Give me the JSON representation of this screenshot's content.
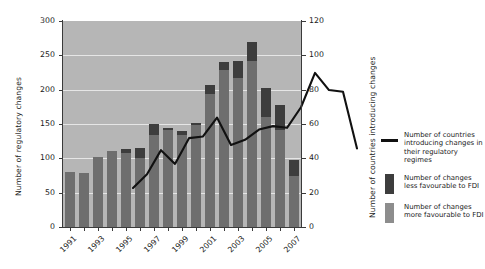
{
  "chart_data": {
    "type": "bar",
    "title": "",
    "subtitle": "",
    "xlabel": "",
    "ylabel": "Number of regulatory changes",
    "ylabel_right": "Number of countries introducing changes",
    "ylim": [
      0,
      300
    ],
    "ylim_right": [
      0,
      120
    ],
    "yticks": [
      0,
      50,
      100,
      150,
      200,
      250,
      300
    ],
    "yticks_right": [
      0,
      20,
      40,
      60,
      80,
      100,
      120
    ],
    "grid": true,
    "legend_position": "right",
    "x": [
      1991,
      1992,
      1993,
      1994,
      1995,
      1996,
      1997,
      1998,
      1999,
      2000,
      2001,
      2002,
      2003,
      2004,
      2005,
      2006,
      2007
    ],
    "xtick_labels": [
      "1991",
      "",
      "1993",
      "",
      "1995",
      "",
      "1997",
      "",
      "1999",
      "",
      "2001",
      "",
      "2003",
      "",
      "2005",
      "",
      "2007"
    ],
    "xtick_labels_shown": [
      "1991",
      "1993",
      "1995",
      "1997",
      "1999",
      "2001",
      "2003",
      "2005",
      "2007"
    ],
    "series": [
      {
        "name": "Number of changes more favourable to FDI",
        "type": "bar-segment",
        "color": "#6e6e6e",
        "values": [
          80,
          78,
          102,
          110,
          108,
          100,
          134,
          142,
          134,
          149,
          193,
          229,
          217,
          242,
          160,
          141,
          74
        ]
      },
      {
        "name": "Number of changes less favourable to FDI",
        "type": "bar-segment",
        "color": "#3d3d3d",
        "values": [
          0,
          0,
          0,
          0,
          5,
          15,
          16,
          2,
          6,
          2,
          14,
          12,
          25,
          28,
          42,
          37,
          24
        ]
      },
      {
        "name": "Number of changes (total)",
        "type": "bar-total",
        "values": [
          80,
          78,
          102,
          110,
          113,
          115,
          150,
          144,
          140,
          151,
          207,
          241,
          242,
          270,
          202,
          178,
          98
        ]
      },
      {
        "name": "Number of countries introducing changes in their regulatory regimes",
        "type": "line",
        "color": "#111111",
        "axis": "right",
        "values": [
          35,
          43,
          57,
          49,
          64,
          65,
          76,
          60,
          63,
          69,
          71,
          70,
          82,
          102,
          92,
          91,
          58
        ]
      }
    ]
  },
  "axes": {
    "left_title": "Number of regulatory changes",
    "right_title": "Number of countries introducing changes"
  },
  "legend": {
    "items": [
      {
        "kind": "line",
        "label_lines": [
          "Number of countries",
          "introducing changes in",
          "their regulatory regimes"
        ],
        "color": "#111111"
      },
      {
        "kind": "swatch",
        "label_lines": [
          "Number of changes",
          "less favourable to FDI"
        ],
        "color": "#3d3d3d"
      },
      {
        "kind": "swatch",
        "label_lines": [
          "Number of changes",
          "more favourable to FDI"
        ],
        "color": "#8d8d8d"
      }
    ]
  },
  "colors": {
    "plot_background": "#b6b6b6",
    "gridline": "#e6e6e6",
    "bar_more": "#6e6e6e",
    "bar_less": "#3d3d3d",
    "line": "#111111",
    "axis": "#3a3a3a",
    "page_background": "#ffffff"
  }
}
